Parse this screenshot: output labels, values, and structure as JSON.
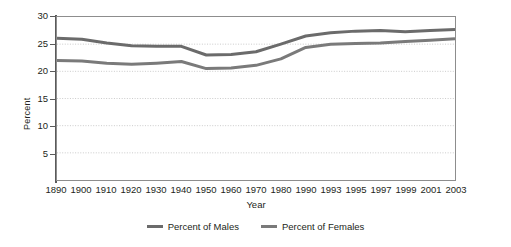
{
  "chart_data": {
    "type": "line",
    "title": "",
    "xlabel": "Year",
    "ylabel": "Percent",
    "categories": [
      "1890",
      "1900",
      "1910",
      "1920",
      "1930",
      "1940",
      "1950",
      "1960",
      "1970",
      "1980",
      "1990",
      "1993",
      "1995",
      "1997",
      "1999",
      "2001",
      "2003"
    ],
    "ylim": [
      0,
      30
    ],
    "yticks": [
      5,
      10,
      15,
      20,
      25,
      30
    ],
    "ytick_labels": [
      "5",
      "10",
      "15",
      "20",
      "25",
      "30"
    ],
    "grid": "horizontal-dotted",
    "legend_position": "bottom-center",
    "series": [
      {
        "name": "Percent of Males",
        "color": "#6b6b6b",
        "values": [
          26.1,
          25.9,
          25.2,
          24.7,
          24.6,
          24.6,
          23.0,
          23.1,
          23.6,
          25.0,
          26.5,
          27.1,
          27.4,
          27.5,
          27.3,
          27.5,
          27.7
        ]
      },
      {
        "name": "Percent of Females",
        "color": "#7a7a7a",
        "values": [
          22.0,
          21.9,
          21.5,
          21.3,
          21.5,
          21.8,
          20.5,
          20.6,
          21.1,
          22.3,
          24.4,
          25.0,
          25.1,
          25.2,
          25.5,
          25.7,
          26.0
        ]
      }
    ]
  },
  "axes": {
    "y_title": "Percent",
    "x_title": "Year"
  },
  "legend": {
    "items": [
      {
        "label": "Percent of Males",
        "color": "#6b6b6b"
      },
      {
        "label": "Percent of Females",
        "color": "#7a7a7a"
      }
    ]
  },
  "colors": {
    "plot_border": "#8d8d8d",
    "gridline": "#bdbdbd",
    "axis_spine": "#5a5a5a",
    "text": "#231f20",
    "background": "#ffffff"
  }
}
